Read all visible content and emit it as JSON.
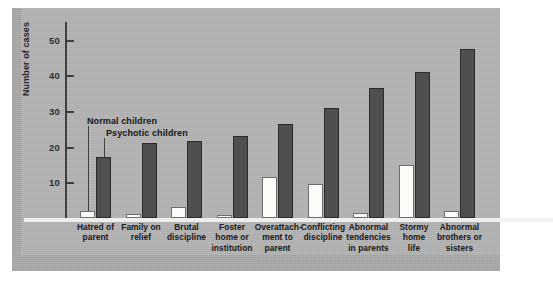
{
  "chart_data": {
    "type": "bar",
    "title": "",
    "xlabel": "",
    "ylabel": "Number of cases",
    "ylim": [
      0,
      55
    ],
    "yticks": [
      10,
      20,
      30,
      40,
      50
    ],
    "ytick_labels": [
      "10",
      "20",
      "30",
      "40",
      "50"
    ],
    "grid": false,
    "legend_position": "inside-upper-left",
    "categories": [
      "Hatred of parent",
      "Family on relief",
      "Brutal discipline",
      "Foster home or institution",
      "Overattach-ment to parent",
      "Conflicting discipline",
      "Abnormal tendencies in parents",
      "Stormy home life",
      "Abnormal brothers or sisters"
    ],
    "category_lines": [
      [
        "Hatred of",
        "parent"
      ],
      [
        "Family on",
        "relief"
      ],
      [
        "Brutal",
        "discipline"
      ],
      [
        "Foster",
        "home or",
        "institution"
      ],
      [
        "Overattach-",
        "ment to",
        "parent"
      ],
      [
        "Conflicting",
        "discipline"
      ],
      [
        "Abnormal",
        "tendencies",
        "in parents"
      ],
      [
        "Stormy",
        "home",
        "life"
      ],
      [
        "Abnormal",
        "brothers or",
        "sisters"
      ]
    ],
    "series": [
      {
        "name": "Normal children",
        "color": "#fbfbf7",
        "values": [
          2,
          1,
          3,
          0.5,
          11.5,
          9.5,
          1.5,
          15,
          2
        ]
      },
      {
        "name": "Psychotic children",
        "color": "#4f4f4f",
        "values": [
          17,
          21,
          21.5,
          23,
          26.5,
          31,
          36.5,
          41,
          47.5
        ]
      }
    ]
  },
  "legend": {
    "normal_label": "Normal children",
    "psychotic_label": "Psychotic children"
  },
  "axis": {
    "ylabel": "Number of cases"
  },
  "colors": {
    "figure_background": "#b3b3b3",
    "page_background": "#ffffff",
    "axis": "#3a3a3a",
    "normal_bar": "#fbfbf7",
    "psychotic_bar": "#4f4f4f",
    "baseline": "#f2f2f0"
  }
}
